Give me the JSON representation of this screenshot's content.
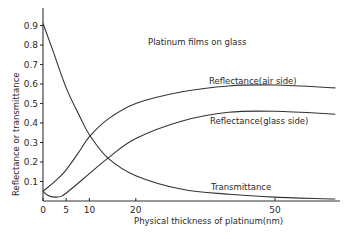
{
  "chart_data": {
    "type": "line",
    "title": "Platinum films on glass",
    "xlabel": "Physical thickness of platinum(nm)",
    "ylabel": "Reflectance or transmittance",
    "xlim": [
      0,
      64
    ],
    "ylim": [
      0,
      1.0
    ],
    "x_ticks": [
      0,
      5,
      10,
      20,
      50
    ],
    "y_ticks": [
      0.1,
      0.2,
      0.3,
      0.4,
      0.5,
      0.6,
      0.7,
      0.8,
      0.9
    ],
    "x_tick_labels": [
      "0",
      "5",
      "10",
      "20",
      "50"
    ],
    "y_tick_labels": [
      "0.1",
      "0.2",
      "0.3",
      "0.4",
      "0.5",
      "0.6",
      "0.7",
      "0.8",
      "0.9"
    ],
    "grid": false,
    "legend": "inline labels on curves",
    "series": [
      {
        "name": "Reflectance(air side)",
        "x": [
          0,
          3,
          5,
          8,
          10,
          14,
          20,
          30,
          40,
          50,
          63
        ],
        "values": [
          0.05,
          0.11,
          0.16,
          0.26,
          0.33,
          0.42,
          0.5,
          0.56,
          0.59,
          0.595,
          0.58
        ]
      },
      {
        "name": "Reflectance(glass side)",
        "x": [
          0,
          1,
          2.5,
          4,
          6,
          10,
          14,
          20,
          30,
          40,
          50,
          63
        ],
        "values": [
          0.05,
          0.03,
          0.02,
          0.025,
          0.06,
          0.14,
          0.22,
          0.32,
          0.41,
          0.455,
          0.46,
          0.445
        ]
      },
      {
        "name": "Transmittance",
        "x": [
          0,
          2,
          5,
          8,
          10,
          14,
          20,
          30,
          40,
          50,
          63
        ],
        "values": [
          0.91,
          0.78,
          0.58,
          0.43,
          0.34,
          0.22,
          0.13,
          0.06,
          0.035,
          0.02,
          0.01
        ]
      }
    ]
  },
  "labels": {
    "title": "Platinum films on glass",
    "xlabel": "Physical thickness of platinum(nm)",
    "ylabel": "Reflectance or transmittance",
    "air": "Reflectance(air side)",
    "glass": "Reflectance(glass side)",
    "trans": "Transmittance"
  }
}
